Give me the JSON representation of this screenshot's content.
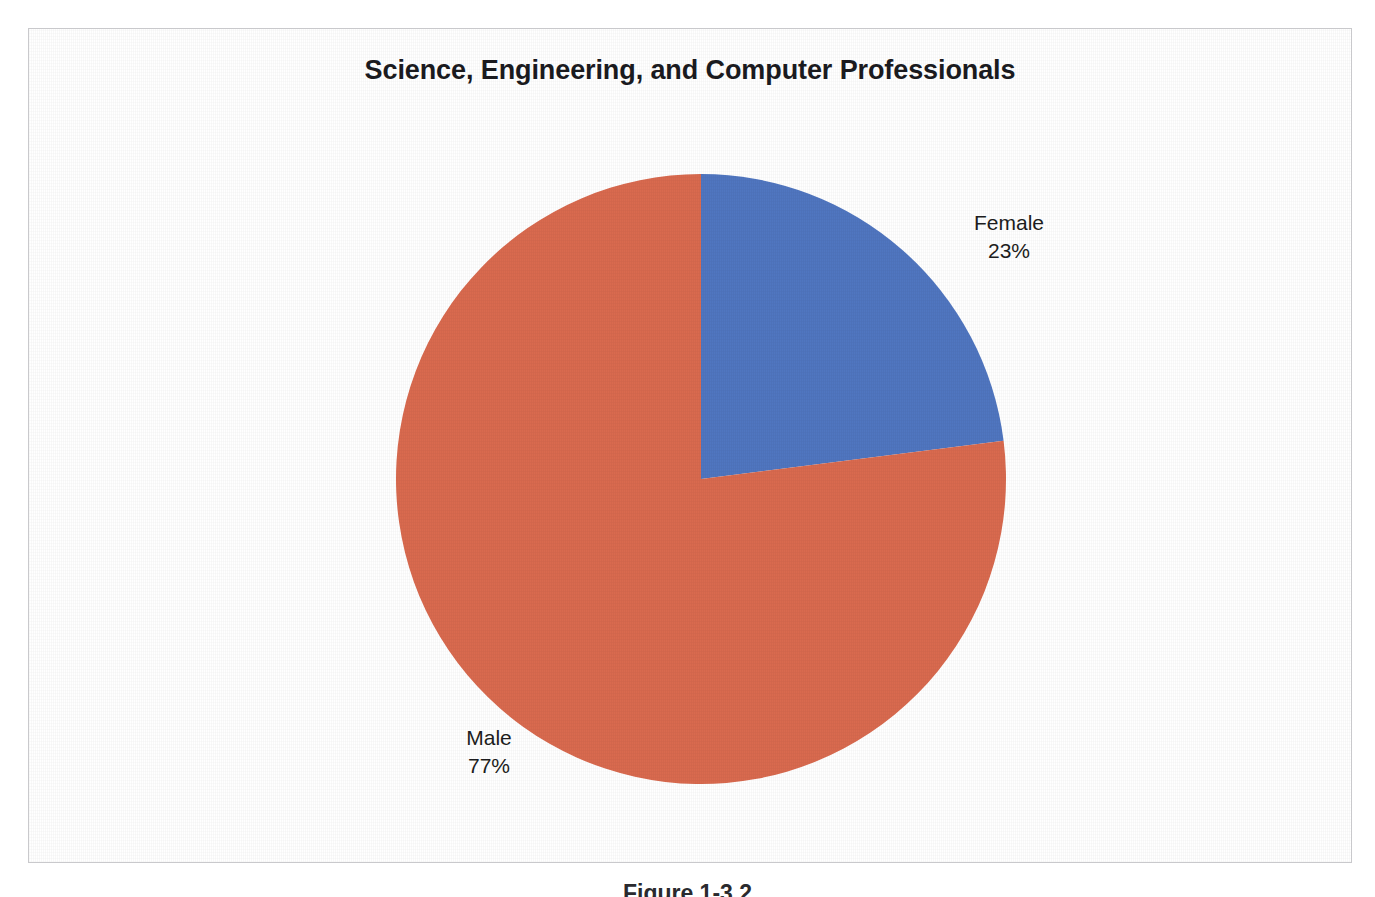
{
  "figure": {
    "title": "Science, Engineering, and Computer Professionals",
    "caption": "Figure 1-3.2",
    "frame_color": "#c9c9cc",
    "background": "#ffffff"
  },
  "labels": {
    "female": {
      "name": "Female",
      "value": "23%"
    },
    "male": {
      "name": "Male",
      "value": "77%"
    }
  },
  "chart_data": {
    "type": "pie",
    "title": "Science, Engineering, and Computer Professionals",
    "subtitle": "",
    "xlabel": "",
    "ylabel": "",
    "grid": false,
    "legend": false,
    "legend_position": "none",
    "labels_on_slices": true,
    "start_angle_deg": 0,
    "direction": "clockwise",
    "units": "percent",
    "total": 100,
    "categories": [
      "Female",
      "Male"
    ],
    "values": [
      23,
      77
    ],
    "colors": [
      "#5076c0",
      "#d96a4f"
    ],
    "data_labels": [
      "Female\n23%",
      "Male\n77%"
    ],
    "slices": [
      {
        "name": "Female",
        "value": 23,
        "display_value": "23%",
        "color": "#5076c0",
        "start_angle_deg": 0,
        "end_angle_deg": 82.8,
        "label_position": "outside-right"
      },
      {
        "name": "Male",
        "value": 77,
        "display_value": "77%",
        "color": "#d96a4f",
        "start_angle_deg": 82.8,
        "end_angle_deg": 360,
        "label_position": "outside-left"
      }
    ]
  }
}
